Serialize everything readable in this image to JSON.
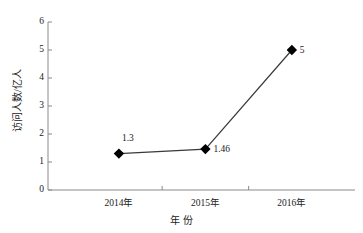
{
  "chart_data": {
    "type": "line",
    "title": "",
    "subtitle": "",
    "xlabel": "年  份",
    "ylabel": "访问人数/亿人",
    "categories": [
      "2014年",
      "2015年",
      "2016年"
    ],
    "series": [
      {
        "name": "访问人数",
        "values": [
          1.3,
          1.46,
          5
        ],
        "point_labels": [
          "1.3",
          "1.46",
          "5"
        ],
        "marker": "diamond",
        "marker_color": "#000000",
        "line_color": "#3a3a3a"
      }
    ],
    "ylim": [
      0,
      6
    ],
    "ytick_labels": [
      "0",
      "1",
      "2",
      "3",
      "4",
      "5",
      "6"
    ],
    "ytick_values": [
      0,
      1,
      2,
      3,
      4,
      5,
      6
    ],
    "grid": false,
    "legend": false,
    "legend_position": "none",
    "axes_visible": [
      "left",
      "bottom"
    ],
    "background_color": "#ffffff"
  }
}
